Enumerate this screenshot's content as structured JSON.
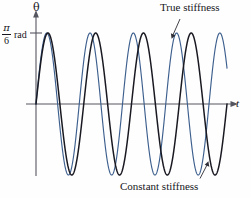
{
  "figure": {
    "axes": {
      "y_label": "θ",
      "x_label": "t",
      "tick": {
        "numerator": "π",
        "denominator": "6",
        "unit": "rad"
      }
    },
    "annotations": [
      {
        "name": "true-stiffness",
        "text": "True stiffness"
      },
      {
        "name": "constant-stiffness",
        "text": "Constant stiffness"
      }
    ],
    "colors": {
      "true_stiffness_curve": "#3d5f8e",
      "constant_stiffness_curve": "#191922",
      "axis": "#4a4a55",
      "background": "#fefefe"
    }
  },
  "chart_data": {
    "type": "line",
    "title": "",
    "xlabel": "t",
    "ylabel": "θ",
    "grid": false,
    "legend_position": "annotations",
    "xlim": [
      0,
      10.2
    ],
    "ylim": [
      -1.18,
      1.18
    ],
    "yticks": [
      1.0
    ],
    "ytick_labels": [
      "π/6 rad"
    ],
    "series": [
      {
        "name": "True stiffness",
        "color": "#3d5f8e",
        "amplitude": 1.0,
        "period": 2.31,
        "phase_deg": 0,
        "x": [
          0.0,
          0.12,
          0.23,
          0.35,
          0.46,
          0.58,
          0.69,
          0.81,
          0.92,
          1.04,
          1.16,
          1.27,
          1.39,
          1.5,
          1.62,
          1.73,
          1.85,
          1.96,
          2.08,
          2.2,
          2.31,
          2.43,
          2.54,
          2.66,
          2.77,
          2.89,
          3.0,
          3.12,
          3.24,
          3.35,
          3.47,
          3.58,
          3.7,
          3.81,
          3.93,
          4.04,
          4.16,
          4.28,
          4.39,
          4.51,
          4.62,
          4.74,
          4.85,
          4.97,
          5.08,
          5.2,
          5.32,
          5.43,
          5.55,
          5.66,
          5.78,
          5.89,
          6.01,
          6.12,
          6.24,
          6.36,
          6.47,
          6.59,
          6.7,
          6.82,
          6.93,
          7.05,
          7.16,
          7.28,
          7.4,
          7.51,
          7.63,
          7.74,
          7.86,
          7.97,
          8.09,
          8.2,
          8.32,
          8.44,
          8.55,
          8.67,
          8.78,
          8.9,
          9.01,
          9.13,
          9.24,
          9.36,
          9.48,
          9.59,
          9.71,
          9.82,
          9.94,
          10.05
        ],
        "y": [
          0.0,
          0.32,
          0.6,
          0.82,
          0.96,
          1.0,
          0.96,
          0.82,
          0.6,
          0.32,
          0.0,
          -0.32,
          -0.6,
          -0.82,
          -0.96,
          -1.0,
          -0.96,
          -0.82,
          -0.6,
          -0.32,
          0.0,
          0.32,
          0.6,
          0.82,
          0.96,
          1.0,
          0.96,
          0.82,
          0.6,
          0.32,
          0.0,
          -0.32,
          -0.6,
          -0.82,
          -0.96,
          -1.0,
          -0.96,
          -0.82,
          -0.6,
          -0.32,
          0.0,
          0.32,
          0.6,
          0.82,
          0.96,
          1.0,
          0.96,
          0.82,
          0.6,
          0.32,
          0.0,
          -0.32,
          -0.6,
          -0.82,
          -0.96,
          -1.0,
          -0.96,
          -0.82,
          -0.6,
          -0.32,
          0.0,
          0.32,
          0.6,
          0.82,
          0.96,
          1.0,
          0.96,
          0.82,
          0.6,
          0.32,
          0.0,
          -0.32,
          -0.6,
          -0.82,
          -0.96,
          -1.0,
          -0.96,
          -0.82,
          -0.6,
          -0.32,
          0.0,
          0.32,
          0.6,
          0.82,
          0.96,
          1.0,
          0.96,
          0.82
        ]
      },
      {
        "name": "Constant stiffness",
        "color": "#191922",
        "amplitude": 1.0,
        "period": 2.55,
        "phase_deg": 0,
        "x": [
          0.0,
          0.13,
          0.26,
          0.38,
          0.51,
          0.64,
          0.77,
          0.89,
          1.02,
          1.15,
          1.28,
          1.4,
          1.53,
          1.66,
          1.79,
          1.91,
          2.04,
          2.17,
          2.3,
          2.42,
          2.55,
          2.68,
          2.81,
          2.93,
          3.06,
          3.19,
          3.32,
          3.44,
          3.57,
          3.7,
          3.83,
          3.95,
          4.08,
          4.21,
          4.34,
          4.46,
          4.59,
          4.72,
          4.85,
          4.97,
          5.1,
          5.23,
          5.36,
          5.48,
          5.61,
          5.74,
          5.87,
          5.99,
          6.12,
          6.25,
          6.38,
          6.5,
          6.63,
          6.76,
          6.89,
          7.01,
          7.14,
          7.27,
          7.4,
          7.52,
          7.65,
          7.78,
          7.91,
          8.03,
          8.16,
          8.29,
          8.42,
          8.54,
          8.67,
          8.8,
          8.93,
          9.05,
          9.18,
          9.31,
          9.44,
          9.56,
          9.69,
          9.82,
          9.95,
          10.07
        ],
        "y": [
          0.0,
          0.32,
          0.6,
          0.82,
          0.96,
          1.0,
          0.96,
          0.82,
          0.6,
          0.32,
          0.0,
          -0.32,
          -0.6,
          -0.82,
          -0.96,
          -1.0,
          -0.96,
          -0.82,
          -0.6,
          -0.32,
          0.0,
          0.32,
          0.6,
          0.82,
          0.96,
          1.0,
          0.96,
          0.82,
          0.6,
          0.32,
          0.0,
          -0.32,
          -0.6,
          -0.82,
          -0.96,
          -1.0,
          -0.96,
          -0.82,
          -0.6,
          -0.32,
          0.0,
          0.32,
          0.6,
          0.82,
          0.96,
          1.0,
          0.96,
          0.82,
          0.6,
          0.32,
          0.0,
          -0.32,
          -0.6,
          -0.82,
          -0.96,
          -1.0,
          -0.96,
          -0.82,
          -0.6,
          -0.32,
          0.0,
          0.32,
          0.6,
          0.82,
          0.96,
          1.0,
          0.96,
          0.82,
          0.6,
          0.32,
          0.0,
          -0.32,
          -0.6,
          -0.82,
          -0.96,
          -1.0,
          -0.96,
          -0.82,
          -0.6,
          -0.32
        ]
      }
    ]
  }
}
